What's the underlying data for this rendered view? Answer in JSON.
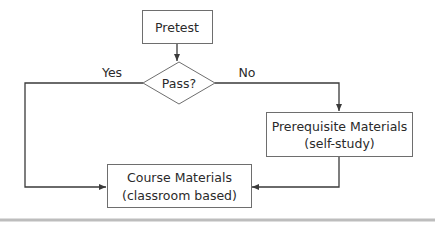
{
  "diagram": {
    "type": "flowchart",
    "nodes": {
      "pretest": {
        "label": "Pretest"
      },
      "decision": {
        "label": "Pass?"
      },
      "prerequisite": {
        "line1": "Prerequisite Materials",
        "line2": "(self-study)"
      },
      "course": {
        "line1": "Course Materials",
        "line2": "(classroom based)"
      }
    },
    "edges": {
      "pretest_to_decision": {
        "from": "Pretest",
        "to": "Pass?",
        "label": ""
      },
      "decision_yes": {
        "from": "Pass?",
        "to": "Course Materials",
        "label": "Yes"
      },
      "decision_no": {
        "from": "Pass?",
        "to": "Prerequisite Materials",
        "label": "No"
      },
      "prereq_to_course": {
        "from": "Prerequisite Materials",
        "to": "Course Materials",
        "label": ""
      }
    },
    "colors": {
      "line": "#3a3a3a",
      "box_border": "#6e6e6e",
      "text": "#2a2a2a",
      "rule": "#bdbdbd"
    }
  }
}
